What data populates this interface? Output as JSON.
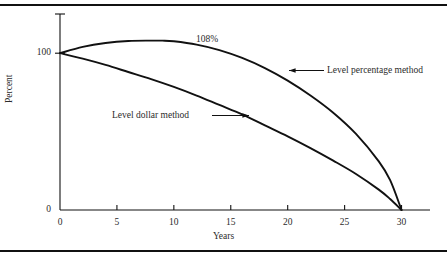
{
  "figure": {
    "background_color": "#ffffff",
    "line_color": "#111111",
    "rule_top_name": "top-horizontal-rule",
    "rule_bottom_name": "bottom-horizontal-rule"
  },
  "chart_data": {
    "type": "line",
    "title": "",
    "xlabel": "Years",
    "ylabel": "Percent",
    "xlim": [
      0,
      32.5
    ],
    "ylim": [
      0,
      125
    ],
    "grid": false,
    "legend_position": "inline-annotations",
    "xticks": [
      0,
      5,
      10,
      15,
      20,
      25,
      30
    ],
    "xtick_labels": [
      "0",
      "5",
      "10",
      "15",
      "20",
      "25",
      "30"
    ],
    "yticks": [
      0,
      100
    ],
    "ytick_labels": [
      "0",
      "100"
    ],
    "annotations": [
      {
        "text": "108%",
        "x": 10,
        "y": 114
      },
      {
        "text": "Level percentage method",
        "x": 23.5,
        "y": 80,
        "arrow": "left"
      },
      {
        "text": "Level dollar method",
        "x": 5.5,
        "y": 57,
        "arrow": "right"
      }
    ],
    "series": [
      {
        "name": "Level percentage method",
        "x": [
          0,
          2,
          4,
          6,
          8,
          9,
          10,
          12,
          14,
          16,
          18,
          20,
          22,
          24,
          26,
          28,
          29,
          30
        ],
        "values": [
          100,
          104,
          106.5,
          107.8,
          108,
          108,
          107.6,
          105.5,
          102,
          97,
          90.5,
          82.5,
          73,
          62,
          48.5,
          31,
          19,
          0
        ]
      },
      {
        "name": "Level dollar method",
        "x": [
          0,
          2,
          4,
          6,
          8,
          10,
          12,
          14,
          16,
          18,
          20,
          22,
          24,
          26,
          28,
          29,
          30
        ],
        "values": [
          100,
          96.5,
          92.5,
          88,
          83.5,
          78.5,
          73,
          67,
          61,
          54,
          47,
          39.5,
          31.5,
          23,
          13,
          7,
          0
        ]
      }
    ]
  },
  "axis": {
    "y_label": "Percent",
    "x_label": "Years"
  }
}
